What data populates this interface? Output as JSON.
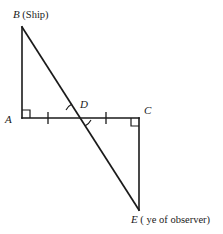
{
  "figure": {
    "background_color": "#ffffff",
    "stroke_color": "#1a1a1a",
    "labels": {
      "b": "B",
      "b_note": "(Ship)",
      "a": "A",
      "c": "C",
      "d": "D",
      "e": "E",
      "e_note": "( ye of observer)"
    },
    "points": {
      "B": {
        "x": 22,
        "y": 27
      },
      "A": {
        "x": 22,
        "y": 118
      },
      "D": {
        "x": 78,
        "y": 118
      },
      "C": {
        "x": 139,
        "y": 118
      },
      "E": {
        "x": 139,
        "y": 210
      }
    },
    "segments": [
      {
        "name": "AB",
        "from": "A",
        "to": "B"
      },
      {
        "name": "AC",
        "from": "A",
        "to": "C"
      },
      {
        "name": "CE",
        "from": "C",
        "to": "E"
      },
      {
        "name": "BE",
        "from": "B",
        "to": "E"
      }
    ],
    "right_angles": [
      "A",
      "C"
    ],
    "tick_marks": [
      {
        "on": "AD",
        "x": 48,
        "y": 118
      },
      {
        "on": "DC",
        "x": 106,
        "y": 118
      }
    ],
    "angle_arcs": [
      {
        "at": "D",
        "position": "upper-left"
      },
      {
        "at": "D",
        "position": "lower-right"
      }
    ]
  }
}
